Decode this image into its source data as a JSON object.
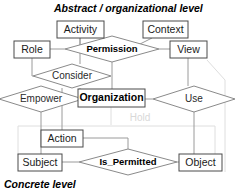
{
  "diagram": {
    "type": "entity-relationship-diagram",
    "levels": [
      {
        "id": "abstract",
        "label": "Abstract / organizational level",
        "x": 54,
        "y": 12
      },
      {
        "id": "concrete",
        "label": "Concrete level",
        "x": 4,
        "y": 182
      }
    ],
    "entities": [
      {
        "id": "activity",
        "label": "Activity",
        "x": 57,
        "y": 21,
        "w": 47,
        "h": 17,
        "bold": false
      },
      {
        "id": "context",
        "label": "Context",
        "x": 143,
        "y": 21,
        "w": 45,
        "h": 17,
        "bold": false
      },
      {
        "id": "role",
        "label": "Role",
        "x": 14,
        "y": 41,
        "w": 36,
        "h": 17,
        "bold": false
      },
      {
        "id": "view",
        "label": "View",
        "x": 170,
        "y": 41,
        "w": 37,
        "h": 17,
        "bold": false
      },
      {
        "id": "organization",
        "label": "Organization",
        "x": 78,
        "y": 89,
        "w": 67,
        "h": 17,
        "bold": true
      },
      {
        "id": "action",
        "label": "Action",
        "x": 41,
        "y": 130,
        "w": 42,
        "h": 17,
        "bold": false
      },
      {
        "id": "subject",
        "label": "Subject",
        "x": 18,
        "y": 154,
        "w": 44,
        "h": 17,
        "bold": false
      },
      {
        "id": "object",
        "label": "Object",
        "x": 179,
        "y": 154,
        "w": 43,
        "h": 17,
        "bold": false
      }
    ],
    "relationships": [
      {
        "id": "permission",
        "label": "Permission",
        "cx": 112,
        "cy": 49,
        "rx": 47,
        "ry": 13,
        "bold": true
      },
      {
        "id": "consider",
        "label": "Consider",
        "cx": 72,
        "cy": 76,
        "rx": 39,
        "ry": 12,
        "bold": false
      },
      {
        "id": "empower",
        "label": "Empower",
        "cx": 41,
        "cy": 99,
        "rx": 42,
        "ry": 13,
        "bold": false
      },
      {
        "id": "use",
        "label": "Use",
        "cx": 194,
        "cy": 99,
        "rx": 41,
        "ry": 13,
        "bold": false
      },
      {
        "id": "is_permitted",
        "label": "Is_Permitted",
        "cx": 128,
        "cy": 162,
        "rx": 49,
        "ry": 13,
        "bold": true
      }
    ],
    "faint_labels": [
      {
        "id": "hold",
        "label": "Hold",
        "x": 140,
        "y": 118
      }
    ],
    "colors": {
      "entity_stroke": "#4a4a4a",
      "relationship_stroke": "#8a8a8a",
      "connector": "#9a9a9a",
      "connector_faint": "#dedede",
      "text": "#1a1a1a",
      "faint_text": "#d8d8d8",
      "background": "#ffffff"
    }
  }
}
